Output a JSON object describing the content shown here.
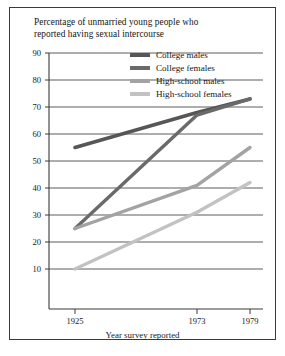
{
  "chart_data": {
    "type": "line",
    "title": "Percentage of unmarried young people who reported having sexual intercourse",
    "title_line1": "Percentage of unmarried young people who",
    "title_line2": "reported having sexual intercourse",
    "xlabel": "Year survey reported",
    "ylabel": "",
    "x": [
      1925,
      1973,
      1979
    ],
    "xtick_labels": [
      "1925",
      "1973",
      "1979"
    ],
    "ytick_labels": [
      "90",
      "80",
      "70",
      "60",
      "50",
      "40",
      "30",
      "20",
      "10"
    ],
    "yticks": [
      90,
      80,
      70,
      60,
      50,
      40,
      30,
      20,
      10
    ],
    "xlim": [
      1925,
      1979
    ],
    "ylim": [
      0,
      90
    ],
    "grid": true,
    "grid_orientation": "horizontal",
    "legend_position": "top-right-inside",
    "series": [
      {
        "name": "College males",
        "values": [
          55,
          68,
          73
        ],
        "color": "#565656",
        "width": 3.6
      },
      {
        "name": "College females",
        "values": [
          25,
          67,
          73
        ],
        "color": "#6a6a6a",
        "width": 3.4
      },
      {
        "name": "High-school males",
        "values": [
          25,
          41,
          55
        ],
        "color": "#a3a3a3",
        "width": 3.4
      },
      {
        "name": "High-school females",
        "values": [
          10,
          31,
          42
        ],
        "color": "#c2c2c2",
        "width": 3.4
      }
    ]
  },
  "axes": {
    "frame_color": "#3a3a3a",
    "grid_color": "#4a4a4a",
    "background": "#ffffff"
  }
}
